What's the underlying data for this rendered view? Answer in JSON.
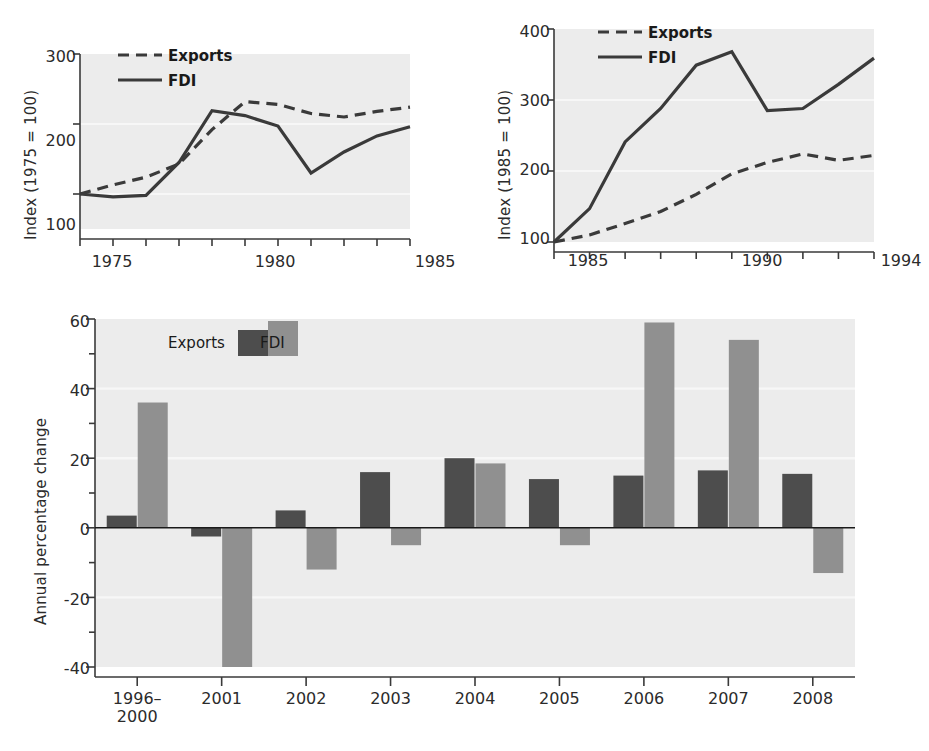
{
  "figure": {
    "background": "#ffffff",
    "plot_background": "#ececec",
    "gridline_color": "#f7f7f7",
    "axis_color": "#3a3a3a",
    "series_colors": {
      "exports_line": "#3a3a3a",
      "fdi_line": "#3a3a3a",
      "exports_bar": "#4d4d4d",
      "fdi_bar": "#909090"
    }
  },
  "chart_data": [
    {
      "id": "chart-1",
      "type": "line",
      "title": "",
      "xlabel": "",
      "ylabel": "Index (1975 = 100)",
      "xlim": [
        1975,
        1985
      ],
      "ylim": [
        50,
        300
      ],
      "xticks": [
        1975,
        1976,
        1977,
        1978,
        1979,
        1980,
        1981,
        1982,
        1983,
        1984,
        1985
      ],
      "xtick_labels": [
        "1975",
        "",
        "",
        "",
        "",
        "1980",
        "",
        "",
        "",
        "",
        "1985"
      ],
      "yticks": [
        100,
        200,
        300
      ],
      "ytick_labels": [
        "100",
        "200",
        "300"
      ],
      "grid": true,
      "legend_position": "top-left",
      "x": [
        1975,
        1976,
        1977,
        1978,
        1979,
        1980,
        1981,
        1982,
        1983,
        1984,
        1985
      ],
      "series": [
        {
          "name": "Exports",
          "style": "dashed",
          "values": [
            100,
            113,
            124,
            143,
            192,
            232,
            228,
            215,
            210,
            218,
            224
          ]
        },
        {
          "name": "FDI",
          "style": "solid",
          "values": [
            100,
            96,
            98,
            145,
            219,
            212,
            197,
            130,
            160,
            183,
            196
          ]
        }
      ]
    },
    {
      "id": "chart-2",
      "type": "line",
      "title": "",
      "xlabel": "",
      "ylabel": "Index (1985 = 100)",
      "xlim": [
        1985,
        1994
      ],
      "ylim": [
        100,
        400
      ],
      "xticks": [
        1985,
        1986,
        1987,
        1988,
        1989,
        1990,
        1991,
        1992,
        1993,
        1994
      ],
      "xtick_labels": [
        "1985",
        "",
        "",
        "",
        "",
        "1990",
        "",
        "",
        "",
        "1994"
      ],
      "yticks": [
        100,
        200,
        300,
        400
      ],
      "ytick_labels": [
        "100",
        "200",
        "300",
        "400"
      ],
      "grid": true,
      "legend_position": "top-left",
      "x": [
        1985,
        1986,
        1987,
        1988,
        1989,
        1990,
        1991,
        1992,
        1993,
        1994
      ],
      "series": [
        {
          "name": "Exports",
          "style": "dashed",
          "values": [
            100,
            110,
            126,
            143,
            167,
            196,
            212,
            224,
            215,
            222
          ]
        },
        {
          "name": "FDI",
          "style": "solid",
          "values": [
            100,
            147,
            241,
            288,
            349,
            368,
            285,
            288,
            322,
            359
          ]
        }
      ]
    },
    {
      "id": "chart-3",
      "type": "bar",
      "title": "",
      "xlabel": "",
      "ylabel": "Annual percentage change",
      "categories": [
        "1996–\n2000",
        "2001",
        "2002",
        "2003",
        "2004",
        "2005",
        "2006",
        "2007",
        "2008"
      ],
      "category_labels_line1": [
        "1996–",
        "2001",
        "2002",
        "2003",
        "2004",
        "2005",
        "2006",
        "2007",
        "2008"
      ],
      "category_labels_line2": [
        "2000",
        "",
        "",
        "",
        "",
        "",
        "",
        "",
        ""
      ],
      "ylim": [
        -40,
        60
      ],
      "yticks": [
        -40,
        -20,
        0,
        20,
        40,
        60
      ],
      "ytick_labels": [
        "-40",
        "-20",
        "0",
        "20",
        "40",
        "60"
      ],
      "minor_ytick_step": 10,
      "grid": true,
      "legend_position": "top-left-inside",
      "series": [
        {
          "name": "Exports",
          "color": "#4d4d4d",
          "values": [
            3.5,
            -2.5,
            5.0,
            16.0,
            20.0,
            14.0,
            15.0,
            16.5,
            15.5
          ]
        },
        {
          "name": "FDI",
          "color": "#909090",
          "values": [
            36.0,
            -40.0,
            -12.0,
            -5.0,
            18.5,
            -5.0,
            59.0,
            54.0,
            -13.0
          ]
        }
      ],
      "notes": "2001 FDI bar is clipped at the -40 axis limit"
    }
  ],
  "chart1": {
    "ylabel": "Index (1975 = 100)",
    "ytick_labels": [
      "300",
      "200",
      "100"
    ],
    "xtick_labels": [
      "1975",
      "1980",
      "1985"
    ],
    "legend": {
      "exports": "Exports",
      "fdi": "FDI"
    }
  },
  "chart2": {
    "ylabel": "Index (1985 = 100)",
    "ytick_labels": [
      "400",
      "300",
      "200",
      "100"
    ],
    "xtick_labels": [
      "1985",
      "1990",
      "1994"
    ],
    "legend": {
      "exports": "Exports",
      "fdi": "FDI"
    }
  },
  "chart3": {
    "ylabel": "Annual percentage change",
    "ytick_labels": [
      "60",
      "40",
      "20",
      "0",
      "-20",
      "-40"
    ],
    "xtick_labels_line1": [
      "1996–",
      "2001",
      "2002",
      "2003",
      "2004",
      "2005",
      "2006",
      "2007",
      "2008"
    ],
    "xtick_labels_line2": [
      "2000",
      "",
      "",
      "",
      "",
      "",
      "",
      "",
      ""
    ],
    "legend": {
      "exports": "Exports",
      "fdi": "FDI"
    }
  }
}
